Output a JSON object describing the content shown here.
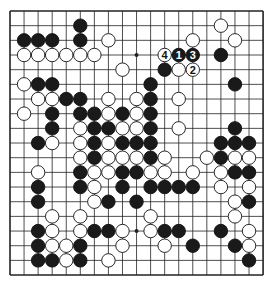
{
  "board": {
    "size": 19,
    "origin": {
      "x": 10,
      "y": 11
    },
    "spacing": {
      "x": 14.06,
      "y": 14.67
    },
    "line_color": "#222222",
    "black_color": "#1a1a1a",
    "white_color": "#ffffff",
    "star_points": [
      [
        3,
        9
      ],
      [
        15,
        9
      ]
    ],
    "stones": [
      {
        "r": 1,
        "c": 5,
        "color": "B"
      },
      {
        "r": 1,
        "c": 15,
        "color": "W"
      },
      {
        "r": 2,
        "c": 1,
        "color": "B"
      },
      {
        "r": 2,
        "c": 2,
        "color": "B"
      },
      {
        "r": 2,
        "c": 3,
        "color": "B"
      },
      {
        "r": 2,
        "c": 5,
        "color": "B"
      },
      {
        "r": 2,
        "c": 7,
        "color": "W"
      },
      {
        "r": 2,
        "c": 13,
        "color": "W"
      },
      {
        "r": 2,
        "c": 16,
        "color": "W"
      },
      {
        "r": 3,
        "c": 1,
        "color": "W"
      },
      {
        "r": 3,
        "c": 2,
        "color": "W"
      },
      {
        "r": 3,
        "c": 3,
        "color": "W"
      },
      {
        "r": 3,
        "c": 4,
        "color": "W"
      },
      {
        "r": 3,
        "c": 5,
        "color": "W"
      },
      {
        "r": 3,
        "c": 6,
        "color": "W"
      },
      {
        "r": 3,
        "c": 11,
        "color": "W",
        "label": "4"
      },
      {
        "r": 3,
        "c": 12,
        "color": "B",
        "label": "1"
      },
      {
        "r": 3,
        "c": 13,
        "color": "B",
        "label": "3"
      },
      {
        "r": 3,
        "c": 15,
        "color": "B"
      },
      {
        "r": 4,
        "c": 8,
        "color": "W"
      },
      {
        "r": 4,
        "c": 11,
        "color": "B"
      },
      {
        "r": 4,
        "c": 12,
        "color": "W"
      },
      {
        "r": 4,
        "c": 13,
        "color": "W",
        "label": "2"
      },
      {
        "r": 5,
        "c": 1,
        "color": "W"
      },
      {
        "r": 5,
        "c": 2,
        "color": "B"
      },
      {
        "r": 5,
        "c": 3,
        "color": "B"
      },
      {
        "r": 5,
        "c": 10,
        "color": "B"
      },
      {
        "r": 5,
        "c": 16,
        "color": "B"
      },
      {
        "r": 6,
        "c": 2,
        "color": "W"
      },
      {
        "r": 6,
        "c": 3,
        "color": "W"
      },
      {
        "r": 6,
        "c": 4,
        "color": "B"
      },
      {
        "r": 6,
        "c": 5,
        "color": "B"
      },
      {
        "r": 6,
        "c": 7,
        "color": "W"
      },
      {
        "r": 6,
        "c": 9,
        "color": "W"
      },
      {
        "r": 6,
        "c": 10,
        "color": "B"
      },
      {
        "r": 6,
        "c": 12,
        "color": "W"
      },
      {
        "r": 7,
        "c": 1,
        "color": "W"
      },
      {
        "r": 7,
        "c": 3,
        "color": "B"
      },
      {
        "r": 7,
        "c": 5,
        "color": "B"
      },
      {
        "r": 7,
        "c": 6,
        "color": "B"
      },
      {
        "r": 7,
        "c": 7,
        "color": "W"
      },
      {
        "r": 7,
        "c": 8,
        "color": "B"
      },
      {
        "r": 7,
        "c": 9,
        "color": "W"
      },
      {
        "r": 7,
        "c": 10,
        "color": "B"
      },
      {
        "r": 8,
        "c": 3,
        "color": "B"
      },
      {
        "r": 8,
        "c": 5,
        "color": "W"
      },
      {
        "r": 8,
        "c": 6,
        "color": "B"
      },
      {
        "r": 8,
        "c": 7,
        "color": "B"
      },
      {
        "r": 8,
        "c": 8,
        "color": "W"
      },
      {
        "r": 8,
        "c": 9,
        "color": "W"
      },
      {
        "r": 8,
        "c": 10,
        "color": "B"
      },
      {
        "r": 8,
        "c": 12,
        "color": "W"
      },
      {
        "r": 8,
        "c": 16,
        "color": "B"
      },
      {
        "r": 9,
        "c": 2,
        "color": "B"
      },
      {
        "r": 9,
        "c": 3,
        "color": "W"
      },
      {
        "r": 9,
        "c": 5,
        "color": "W"
      },
      {
        "r": 9,
        "c": 6,
        "color": "B"
      },
      {
        "r": 9,
        "c": 7,
        "color": "W"
      },
      {
        "r": 9,
        "c": 8,
        "color": "B"
      },
      {
        "r": 9,
        "c": 9,
        "color": "B"
      },
      {
        "r": 9,
        "c": 10,
        "color": "B"
      },
      {
        "r": 9,
        "c": 15,
        "color": "B"
      },
      {
        "r": 9,
        "c": 16,
        "color": "B"
      },
      {
        "r": 9,
        "c": 17,
        "color": "B"
      },
      {
        "r": 10,
        "c": 5,
        "color": "W"
      },
      {
        "r": 10,
        "c": 6,
        "color": "B"
      },
      {
        "r": 10,
        "c": 7,
        "color": "W"
      },
      {
        "r": 10,
        "c": 8,
        "color": "W"
      },
      {
        "r": 10,
        "c": 9,
        "color": "W"
      },
      {
        "r": 10,
        "c": 10,
        "color": "B"
      },
      {
        "r": 10,
        "c": 11,
        "color": "W"
      },
      {
        "r": 10,
        "c": 14,
        "color": "W"
      },
      {
        "r": 10,
        "c": 15,
        "color": "B"
      },
      {
        "r": 10,
        "c": 16,
        "color": "W"
      },
      {
        "r": 10,
        "c": 17,
        "color": "W"
      },
      {
        "r": 11,
        "c": 2,
        "color": "W"
      },
      {
        "r": 11,
        "c": 5,
        "color": "B"
      },
      {
        "r": 11,
        "c": 6,
        "color": "W"
      },
      {
        "r": 11,
        "c": 7,
        "color": "W"
      },
      {
        "r": 11,
        "c": 8,
        "color": "B"
      },
      {
        "r": 11,
        "c": 9,
        "color": "B"
      },
      {
        "r": 11,
        "c": 10,
        "color": "W"
      },
      {
        "r": 11,
        "c": 11,
        "color": "W"
      },
      {
        "r": 11,
        "c": 13,
        "color": "W"
      },
      {
        "r": 11,
        "c": 15,
        "color": "W"
      },
      {
        "r": 11,
        "c": 16,
        "color": "B"
      },
      {
        "r": 11,
        "c": 17,
        "color": "B"
      },
      {
        "r": 12,
        "c": 2,
        "color": "B"
      },
      {
        "r": 12,
        "c": 5,
        "color": "B"
      },
      {
        "r": 12,
        "c": 6,
        "color": "W"
      },
      {
        "r": 12,
        "c": 8,
        "color": "B"
      },
      {
        "r": 12,
        "c": 10,
        "color": "B"
      },
      {
        "r": 12,
        "c": 11,
        "color": "B"
      },
      {
        "r": 12,
        "c": 12,
        "color": "B"
      },
      {
        "r": 12,
        "c": 13,
        "color": "B"
      },
      {
        "r": 12,
        "c": 15,
        "color": "W"
      },
      {
        "r": 12,
        "c": 17,
        "color": "W"
      },
      {
        "r": 13,
        "c": 2,
        "color": "B"
      },
      {
        "r": 13,
        "c": 6,
        "color": "W"
      },
      {
        "r": 13,
        "c": 7,
        "color": "B"
      },
      {
        "r": 13,
        "c": 9,
        "color": "B"
      },
      {
        "r": 13,
        "c": 16,
        "color": "W"
      },
      {
        "r": 13,
        "c": 17,
        "color": "B"
      },
      {
        "r": 14,
        "c": 3,
        "color": "W"
      },
      {
        "r": 14,
        "c": 5,
        "color": "W"
      },
      {
        "r": 14,
        "c": 10,
        "color": "W"
      },
      {
        "r": 14,
        "c": 16,
        "color": "W"
      },
      {
        "r": 15,
        "c": 2,
        "color": "B"
      },
      {
        "r": 15,
        "c": 3,
        "color": "W"
      },
      {
        "r": 15,
        "c": 5,
        "color": "W"
      },
      {
        "r": 15,
        "c": 6,
        "color": "B"
      },
      {
        "r": 15,
        "c": 7,
        "color": "B"
      },
      {
        "r": 15,
        "c": 8,
        "color": "W"
      },
      {
        "r": 15,
        "c": 10,
        "color": "W"
      },
      {
        "r": 15,
        "c": 11,
        "color": "B"
      },
      {
        "r": 15,
        "c": 12,
        "color": "B"
      },
      {
        "r": 15,
        "c": 15,
        "color": "B"
      },
      {
        "r": 15,
        "c": 17,
        "color": "W"
      },
      {
        "r": 16,
        "c": 2,
        "color": "B"
      },
      {
        "r": 16,
        "c": 3,
        "color": "W"
      },
      {
        "r": 16,
        "c": 4,
        "color": "W"
      },
      {
        "r": 16,
        "c": 5,
        "color": "B"
      },
      {
        "r": 16,
        "c": 8,
        "color": "W"
      },
      {
        "r": 16,
        "c": 11,
        "color": "W"
      },
      {
        "r": 16,
        "c": 13,
        "color": "B"
      },
      {
        "r": 16,
        "c": 16,
        "color": "B"
      },
      {
        "r": 16,
        "c": 17,
        "color": "W"
      },
      {
        "r": 17,
        "c": 2,
        "color": "B"
      },
      {
        "r": 17,
        "c": 3,
        "color": "B"
      },
      {
        "r": 17,
        "c": 4,
        "color": "W"
      },
      {
        "r": 17,
        "c": 5,
        "color": "B"
      },
      {
        "r": 17,
        "c": 7,
        "color": "W"
      },
      {
        "r": 17,
        "c": 17,
        "color": "B"
      }
    ]
  }
}
